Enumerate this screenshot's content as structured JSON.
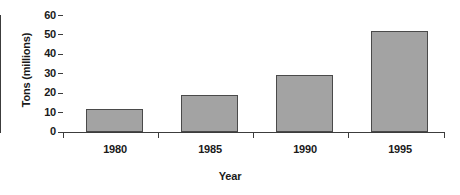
{
  "chart_data": {
    "type": "bar",
    "title": "",
    "subtitle": "",
    "categories": [
      "1980",
      "1985",
      "1990",
      "1995"
    ],
    "values": [
      12,
      19,
      29,
      52
    ],
    "xlabel": "Year",
    "ylabel": "Tons (millions)",
    "ylim": [
      0,
      60
    ],
    "ytick_values": [
      0,
      10,
      20,
      30,
      40,
      50,
      60
    ],
    "ytick_labels": [
      "0",
      "10",
      "20",
      "30",
      "40",
      "50",
      "60"
    ],
    "grid": false,
    "legend": null,
    "legend_position": "none",
    "annotations": [],
    "series": [
      {
        "name": "Tons (millions)",
        "values": [
          12,
          19,
          29,
          52
        ]
      }
    ],
    "colors": {
      "bar_fill": "#a3a3a3",
      "bar_edge": "#4a4a4a",
      "axis": "#3c3c3c",
      "text": "#1a1a1a",
      "background": "#ffffff"
    }
  }
}
